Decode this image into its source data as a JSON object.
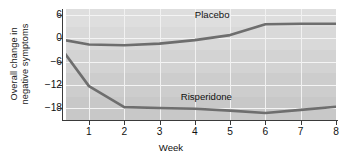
{
  "chart_data": {
    "type": "line",
    "title": "",
    "xlabel": "Week",
    "ylabel_line1": "Overall change in",
    "ylabel_line2": "negative symptoms",
    "x": [
      0,
      1,
      2,
      3,
      4,
      5,
      6,
      7,
      8
    ],
    "xlim": [
      0.35,
      8
    ],
    "ylim": [
      -21,
      7.5
    ],
    "xticks": [
      "1",
      "2",
      "3",
      "4",
      "5",
      "6",
      "7",
      "8"
    ],
    "xtick_values": [
      1,
      2,
      3,
      4,
      5,
      6,
      7,
      8
    ],
    "yticks": [
      "6",
      "0",
      "−6",
      "−12",
      "−18"
    ],
    "ytick_values": [
      6,
      0,
      -6,
      -12,
      -18
    ],
    "grid": "both",
    "legend_position": "inline-annotation",
    "series": [
      {
        "name": "Placebo",
        "label": "Placebo",
        "color": "#6e6e6e",
        "values": [
          0.0,
          -1.6,
          -1.8,
          -1.4,
          -0.5,
          0.8,
          3.6,
          3.7,
          3.7
        ],
        "label_x": 4.0,
        "label_y": 6.0
      },
      {
        "name": "Risperidone",
        "label": "Risperidone",
        "color": "#6e6e6e",
        "values": [
          0.0,
          -12.3,
          -17.7,
          -17.9,
          -18.1,
          -18.6,
          -19.2,
          -18.4,
          -17.6
        ],
        "label_x": 3.6,
        "label_y": -15.2
      }
    ],
    "background": {
      "plot_fill": "#d2d2d2",
      "gridline_color": "#f4f4f4",
      "bands": [
        "#dedede",
        "#d9d9d9",
        "#d3d3d3",
        "#cdcdcd",
        "#c8c8c8"
      ]
    }
  },
  "axes": {
    "spine_color": "#3a3a3a"
  }
}
